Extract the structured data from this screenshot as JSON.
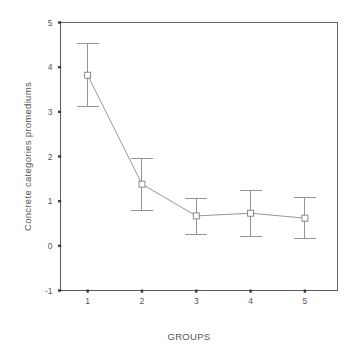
{
  "chart_data": {
    "type": "line",
    "title": "",
    "subtitle": "",
    "xlabel": "GROUPS",
    "ylabel": "Concrete categories promediums",
    "x": [
      1,
      2,
      3,
      4,
      5
    ],
    "categories": [
      "1",
      "2",
      "3",
      "4",
      "5"
    ],
    "values": [
      3.82,
      1.38,
      0.67,
      0.73,
      0.62
    ],
    "error_upper": [
      4.53,
      1.95,
      1.06,
      1.23,
      1.08
    ],
    "error_lower": [
      3.12,
      0.8,
      0.26,
      0.2,
      0.17
    ],
    "series": [
      {
        "name": "Concrete categories promediums",
        "values": [
          3.82,
          1.38,
          0.67,
          0.73,
          0.62
        ],
        "error_upper": [
          4.53,
          1.95,
          1.06,
          1.23,
          1.08
        ],
        "error_lower": [
          3.12,
          0.8,
          0.26,
          0.2,
          0.17
        ]
      }
    ],
    "xlim": [
      0.5,
      5.6
    ],
    "ylim": [
      -1,
      5
    ],
    "ytick_labels": [
      "5",
      "4",
      "3",
      "2",
      "1",
      "0",
      "-1"
    ],
    "ytick_values": [
      5,
      4,
      3,
      2,
      1,
      0,
      -1
    ],
    "xtick_labels": [
      "1",
      "2",
      "3",
      "4",
      "5"
    ],
    "xtick_values": [
      1,
      2,
      3,
      4,
      5
    ],
    "grid": false,
    "legend": false,
    "legend_position": "none",
    "marker": "open-square",
    "error_bar_style": "capped",
    "colors": {
      "line": "#8a8a8a",
      "marker_edge": "#7d7d7d",
      "marker_fill": "#ffffff",
      "axis": "#5a5a5a",
      "frame": "#6b6b6b",
      "text": "#555555",
      "background": "#ffffff"
    }
  },
  "axes": {
    "y_title": "Concrete categories promediums",
    "x_title": "GROUPS"
  },
  "ticks": {
    "y": [
      {
        "label": "5",
        "value": 5
      },
      {
        "label": "4",
        "value": 4
      },
      {
        "label": "3",
        "value": 3
      },
      {
        "label": "2",
        "value": 2
      },
      {
        "label": "1",
        "value": 1
      },
      {
        "label": "0",
        "value": 0
      },
      {
        "label": "-1",
        "value": -1
      }
    ],
    "x": [
      {
        "label": "1",
        "value": 1
      },
      {
        "label": "2",
        "value": 2
      },
      {
        "label": "3",
        "value": 3
      },
      {
        "label": "4",
        "value": 4
      },
      {
        "label": "5",
        "value": 5
      }
    ]
  }
}
